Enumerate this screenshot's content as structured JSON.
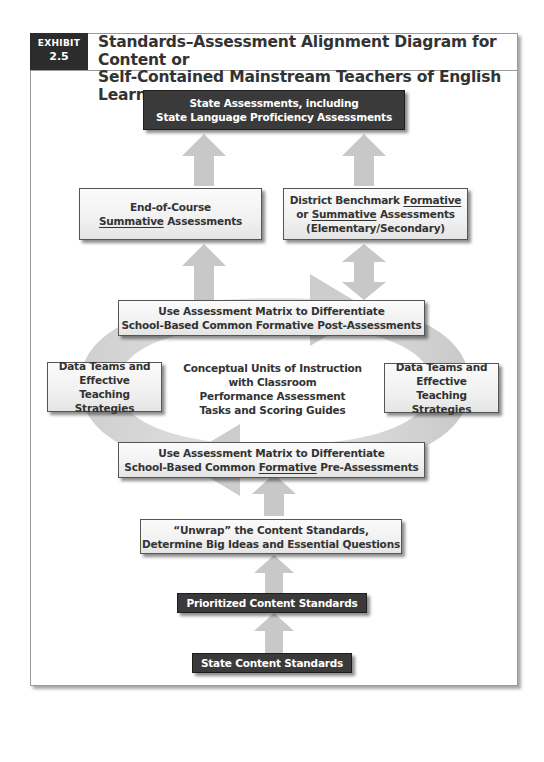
{
  "exhibit": {
    "label": "EXHIBIT",
    "number": "2.5"
  },
  "title": {
    "line1": "Standards–Assessment Alignment Diagram for Content or",
    "line2": "Self-Contained Mainstream Teachers of English Learners"
  },
  "nodes": {
    "state_assessments": {
      "line1": "State Assessments, including",
      "line2": "State Language Proficiency Assessments",
      "style": "dark"
    },
    "end_of_course": {
      "line1": "End-of-Course",
      "line2_underlined": "Summative",
      "line2_rest": " Assessments",
      "style": "light"
    },
    "district_benchmark": {
      "line1_prefix": "District Benchmark ",
      "line1_underlined": "Formative",
      "line2_prefix": "or ",
      "line2_underlined": "Summative",
      "line2_rest": " Assessments",
      "line3": "(Elementary/Secondary)",
      "style": "light"
    },
    "post_assessments": {
      "line1": "Use Assessment Matrix to Differentiate",
      "line2": "School-Based Common Formative Post-Assessments",
      "style": "light"
    },
    "data_teams_left": {
      "line1": "Data Teams and",
      "line2": "Effective",
      "line3": "Teaching Strategies",
      "style": "light"
    },
    "conceptual_units": {
      "line1": "Conceptual Units of Instruction",
      "line2": "with Classroom",
      "line3": "Performance Assessment",
      "line4": "Tasks and Scoring Guides",
      "style": "plain"
    },
    "data_teams_right": {
      "line1": "Data Teams and",
      "line2": "Effective",
      "line3": "Teaching Strategies",
      "style": "light"
    },
    "pre_assessments": {
      "line1": "Use Assessment Matrix to Differentiate",
      "line2_prefix": "School-Based Common ",
      "line2_underlined": "Formative",
      "line2_rest": " Pre-Assessments",
      "style": "light"
    },
    "unwrap": {
      "line1": "“Unwrap” the Content Standards,",
      "line2": "Determine Big Ideas and Essential Questions",
      "style": "light"
    },
    "prioritized": {
      "line1": "Prioritized Content Standards",
      "style": "dark"
    },
    "state_content": {
      "line1": "State Content Standards",
      "style": "dark"
    }
  },
  "edges": [
    {
      "from": "state_content",
      "to": "prioritized",
      "type": "up-arrow"
    },
    {
      "from": "prioritized",
      "to": "unwrap",
      "type": "up-arrow"
    },
    {
      "from": "unwrap",
      "to": "pre_assessments",
      "type": "up-arrow"
    },
    {
      "from": "pre_assessments",
      "to": "post_assessments",
      "type": "cycle-loop"
    },
    {
      "from": "post_assessments",
      "to": "end_of_course",
      "type": "up-arrow"
    },
    {
      "from": "post_assessments",
      "to": "district_benchmark",
      "type": "double-arrow"
    },
    {
      "from": "end_of_course",
      "to": "state_assessments",
      "type": "up-arrow"
    },
    {
      "from": "district_benchmark",
      "to": "state_assessments",
      "type": "up-arrow"
    }
  ],
  "colors": {
    "dark_box": "#3a3a3a",
    "light_box": "#f1f1f1",
    "arrow_fill": "#c8c8c8",
    "loop_fill": "#d9d9d9",
    "frame_border": "#9a9a9a"
  }
}
